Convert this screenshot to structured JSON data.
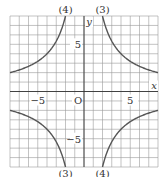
{
  "chart_data": {
    "type": "line",
    "title": "",
    "xlabel": "x",
    "ylabel": "y",
    "origin_label": "O",
    "xlim": [
      -8,
      8
    ],
    "ylim": [
      -8,
      8
    ],
    "grid": true,
    "x_tick_labels": [
      {
        "value": -5,
        "label": "−5"
      },
      {
        "value": 5,
        "label": "5"
      }
    ],
    "y_tick_labels": [
      {
        "value": 5,
        "label": "5"
      },
      {
        "value": -5,
        "label": "−5"
      }
    ],
    "series": [
      {
        "name": "(3)",
        "equation": "y = 16/x",
        "k": 16,
        "label_top": "(3)",
        "label_bottom": "(3)"
      },
      {
        "name": "(4)",
        "equation": "y = -16/x",
        "k": -16,
        "label_top": "(4)",
        "label_bottom": "(4)"
      }
    ]
  }
}
